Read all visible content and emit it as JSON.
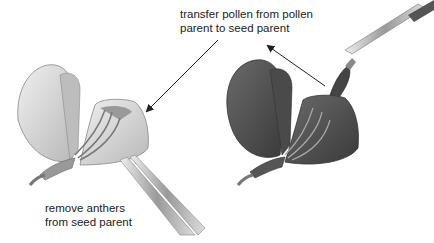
{
  "labels": {
    "transfer": [
      "transfer pollen from pollen",
      "parent to seed parent"
    ],
    "remove": [
      "remove anthers",
      "from seed parent"
    ]
  },
  "figures": {
    "left": {
      "subject": "seed parent flower (light)",
      "tool": "tweezers"
    },
    "right": {
      "subject": "seed parent flower (dark)",
      "tool": "paintbrush"
    }
  },
  "colors": {
    "light_petal": "#d9d9d9",
    "dark_petal": "#555555",
    "arrow": "#222222"
  }
}
